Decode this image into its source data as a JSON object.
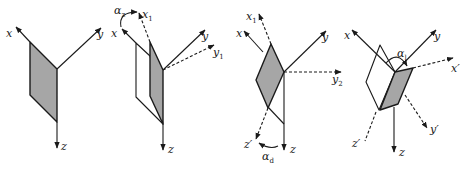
{
  "figure": {
    "panels": [
      {
        "id": "panel-1",
        "labels": {
          "x": "x",
          "y": "y",
          "z": "z"
        }
      },
      {
        "id": "panel-2",
        "labels": {
          "x": "x",
          "y": "y",
          "z": "z",
          "x1": "x",
          "x1_sub": "1",
          "y1": "y",
          "y1_sub": "1",
          "angle": "α",
          "angle_sub": "z"
        }
      },
      {
        "id": "panel-3",
        "labels": {
          "x": "x",
          "y": "y",
          "z": "z",
          "x1": "x",
          "x1_sub": "1",
          "y2": "y",
          "y2_sub": "2",
          "zp": "z′",
          "angle": "α",
          "angle_sub": "d"
        }
      },
      {
        "id": "panel-4",
        "labels": {
          "x": "x",
          "y": "y",
          "z": "z",
          "xp": "x′",
          "yp": "y′",
          "zp": "z′",
          "angle": "α",
          "angle_sub": "l"
        }
      }
    ],
    "colors": {
      "shaded_face": "#a6a6a6",
      "line": "#1a1a1a",
      "background": "#ffffff"
    }
  }
}
